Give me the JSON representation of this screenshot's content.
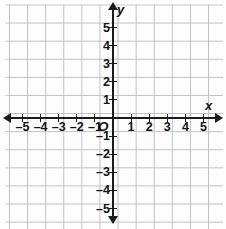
{
  "chart_data": {
    "type": "scatter",
    "title": "",
    "subtitle": "",
    "xlabel": "x",
    "ylabel": "y",
    "xlim": [
      -5.8,
      5.9
    ],
    "ylim": [
      -5.9,
      5.7
    ],
    "xticks": [
      -5,
      -4,
      -3,
      -2,
      -1,
      1,
      2,
      3,
      4,
      5
    ],
    "yticks": [
      5,
      4,
      3,
      2,
      1,
      -1,
      -2,
      -3,
      -4,
      -5
    ],
    "xtick_labels": [
      "–5",
      "–4",
      "–3",
      "–2",
      "–1",
      "1",
      "2",
      "3",
      "4",
      "5"
    ],
    "ytick_labels": [
      "5",
      "4",
      "3",
      "2",
      "1",
      "–1",
      "–2",
      "–3",
      "–4",
      "–5"
    ],
    "origin_label": "O",
    "grid": true,
    "grid_step": 1,
    "legend": null,
    "series": [],
    "annotations": []
  },
  "axes": {
    "x_name": "x",
    "y_name": "y",
    "origin": "O",
    "x_labels": [
      {
        "value": -5,
        "text": "–5"
      },
      {
        "value": -4,
        "text": "–4"
      },
      {
        "value": -3,
        "text": "–3"
      },
      {
        "value": -2,
        "text": "–2"
      },
      {
        "value": -1,
        "text": "–1"
      },
      {
        "value": 1,
        "text": "1"
      },
      {
        "value": 2,
        "text": "2"
      },
      {
        "value": 3,
        "text": "3"
      },
      {
        "value": 4,
        "text": "4"
      },
      {
        "value": 5,
        "text": "5"
      }
    ],
    "y_labels": [
      {
        "value": 5,
        "text": "5"
      },
      {
        "value": 4,
        "text": "4"
      },
      {
        "value": 3,
        "text": "3"
      },
      {
        "value": 2,
        "text": "2"
      },
      {
        "value": 1,
        "text": "1"
      },
      {
        "value": -1,
        "text": "–1"
      },
      {
        "value": -2,
        "text": "–2"
      },
      {
        "value": -3,
        "text": "–3"
      },
      {
        "value": -4,
        "text": "–4"
      },
      {
        "value": -5,
        "text": "–5"
      }
    ]
  },
  "colors": {
    "background": "#fdfdfd",
    "grid_line": "#bdbdbd",
    "axis_line": "#1b1b1b",
    "label_text": "#121212"
  }
}
